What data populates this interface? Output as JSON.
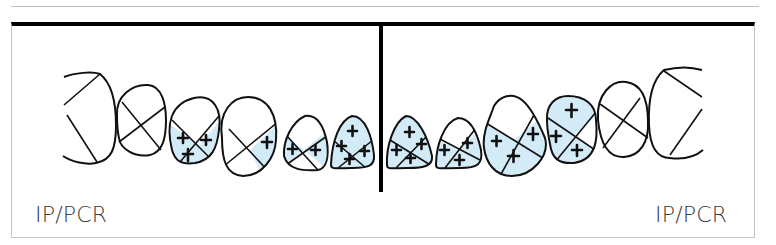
{
  "figure": {
    "type": "dental-plaque-chart",
    "fill_color": "#d3ebf7",
    "line_color": "#111111",
    "frame_color": "#000000",
    "labels": {
      "left": "IP/PCR",
      "right": "IP/PCR"
    }
  },
  "quadrants": [
    {
      "side": "left",
      "teeth": [
        {
          "index": 1,
          "shape": "molar-partial",
          "filled": [],
          "plus_count": 0
        },
        {
          "index": 2,
          "shape": "premolar",
          "filled": [],
          "plus_count": 0
        },
        {
          "index": 3,
          "shape": "premolar",
          "filled": [
            "left",
            "right",
            "bottom"
          ],
          "plus_count": 3
        },
        {
          "index": 4,
          "shape": "canine",
          "filled": [
            "right"
          ],
          "plus_count": 1
        },
        {
          "index": 5,
          "shape": "incisor",
          "filled": [
            "left",
            "right"
          ],
          "plus_count": 2
        },
        {
          "index": 6,
          "shape": "incisor",
          "filled": [
            "top",
            "left",
            "right",
            "bottom"
          ],
          "plus_count": 4
        }
      ]
    },
    {
      "side": "right",
      "teeth": [
        {
          "index": 7,
          "shape": "incisor",
          "filled": [
            "top",
            "left",
            "right",
            "bottom"
          ],
          "plus_count": 4
        },
        {
          "index": 8,
          "shape": "incisor",
          "filled": [
            "left",
            "right",
            "bottom"
          ],
          "plus_count": 3
        },
        {
          "index": 9,
          "shape": "canine",
          "filled": [
            "left",
            "right",
            "bottom"
          ],
          "plus_count": 3
        },
        {
          "index": 10,
          "shape": "premolar",
          "filled": [
            "top",
            "left",
            "bottom"
          ],
          "plus_count": 3
        },
        {
          "index": 11,
          "shape": "premolar",
          "filled": [],
          "plus_count": 0
        },
        {
          "index": 12,
          "shape": "molar-partial",
          "filled": [],
          "plus_count": 0
        }
      ]
    }
  ]
}
